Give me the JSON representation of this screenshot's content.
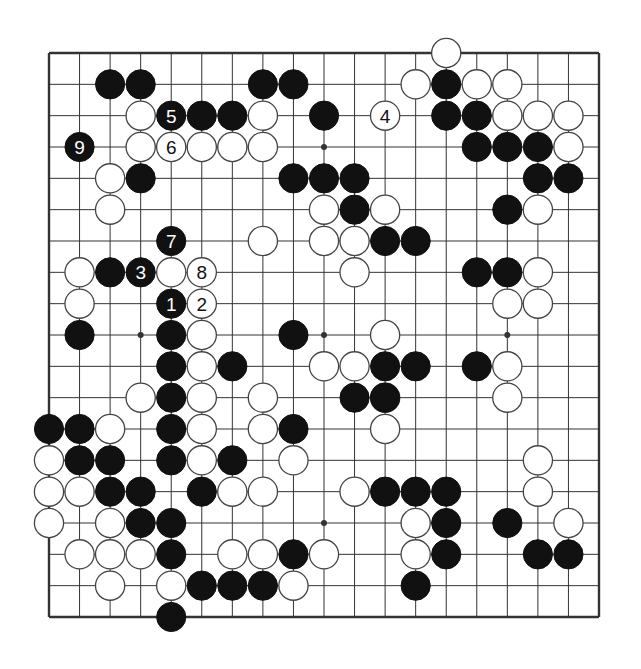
{
  "diagram": {
    "type": "go-board-partial",
    "size": 19,
    "geometry": {
      "x0": 49,
      "y0": 53,
      "x1": 599,
      "y1": 617
    },
    "star_points": [
      [
        3,
        9
      ],
      [
        9,
        3
      ],
      [
        9,
        9
      ],
      [
        9,
        15
      ],
      [
        15,
        9
      ],
      [
        3,
        3
      ],
      [
        15,
        15
      ],
      [
        3,
        15
      ],
      [
        15,
        3
      ]
    ],
    "visible_star_points": [
      [
        9,
        3
      ],
      [
        3,
        9
      ],
      [
        9,
        9
      ],
      [
        9,
        15
      ],
      [
        15,
        9
      ]
    ],
    "colors": {
      "line": "#333333",
      "black": "#111111",
      "white": "#ffffff",
      "outline": "#444444",
      "label_on_black": "#ffffff",
      "label_on_white": "#111111"
    },
    "black_stones": [
      [
        1,
        2
      ],
      [
        1,
        3
      ],
      [
        1,
        7
      ],
      [
        1,
        8
      ],
      [
        1,
        13
      ],
      [
        2,
        4,
        "5"
      ],
      [
        2,
        5
      ],
      [
        2,
        6
      ],
      [
        2,
        9
      ],
      [
        2,
        13
      ],
      [
        2,
        14
      ],
      [
        3,
        1,
        "9"
      ],
      [
        3,
        14
      ],
      [
        3,
        15
      ],
      [
        3,
        16
      ],
      [
        4,
        3
      ],
      [
        4,
        8
      ],
      [
        4,
        9
      ],
      [
        4,
        10
      ],
      [
        4,
        16
      ],
      [
        4,
        17
      ],
      [
        5,
        10
      ],
      [
        5,
        15
      ],
      [
        6,
        4,
        "7"
      ],
      [
        6,
        11
      ],
      [
        6,
        12
      ],
      [
        7,
        2
      ],
      [
        7,
        3,
        "3"
      ],
      [
        7,
        14
      ],
      [
        7,
        15
      ],
      [
        8,
        4,
        "1"
      ],
      [
        9,
        1
      ],
      [
        9,
        4
      ],
      [
        9,
        8
      ],
      [
        10,
        4
      ],
      [
        10,
        6
      ],
      [
        10,
        11
      ],
      [
        10,
        12
      ],
      [
        10,
        14
      ],
      [
        11,
        4
      ],
      [
        11,
        10
      ],
      [
        11,
        11
      ],
      [
        12,
        0
      ],
      [
        12,
        1
      ],
      [
        12,
        4
      ],
      [
        12,
        8
      ],
      [
        13,
        1
      ],
      [
        13,
        2
      ],
      [
        13,
        4
      ],
      [
        13,
        6
      ],
      [
        14,
        2
      ],
      [
        14,
        3
      ],
      [
        14,
        5
      ],
      [
        14,
        11
      ],
      [
        14,
        12
      ],
      [
        14,
        13
      ],
      [
        15,
        3
      ],
      [
        15,
        4
      ],
      [
        15,
        13
      ],
      [
        15,
        15
      ],
      [
        16,
        4
      ],
      [
        16,
        8
      ],
      [
        16,
        13
      ],
      [
        16,
        16
      ],
      [
        16,
        17
      ],
      [
        17,
        5
      ],
      [
        17,
        6
      ],
      [
        17,
        7
      ],
      [
        17,
        12
      ],
      [
        18,
        4
      ]
    ],
    "white_stones": [
      [
        0,
        13
      ],
      [
        1,
        12
      ],
      [
        1,
        14
      ],
      [
        1,
        15
      ],
      [
        2,
        3
      ],
      [
        2,
        7
      ],
      [
        2,
        11,
        "4"
      ],
      [
        2,
        15
      ],
      [
        2,
        16
      ],
      [
        2,
        17
      ],
      [
        3,
        3
      ],
      [
        3,
        4,
        "6"
      ],
      [
        3,
        5
      ],
      [
        3,
        6
      ],
      [
        3,
        7
      ],
      [
        3,
        17
      ],
      [
        4,
        2
      ],
      [
        5,
        2
      ],
      [
        5,
        9
      ],
      [
        5,
        11
      ],
      [
        5,
        16
      ],
      [
        6,
        7
      ],
      [
        6,
        9
      ],
      [
        6,
        10
      ],
      [
        7,
        1
      ],
      [
        7,
        4
      ],
      [
        7,
        5,
        "8"
      ],
      [
        7,
        10
      ],
      [
        7,
        16
      ],
      [
        8,
        1
      ],
      [
        8,
        5,
        "2"
      ],
      [
        8,
        15
      ],
      [
        8,
        16
      ],
      [
        9,
        5
      ],
      [
        9,
        11
      ],
      [
        10,
        5
      ],
      [
        10,
        9
      ],
      [
        10,
        10
      ],
      [
        10,
        15
      ],
      [
        11,
        3
      ],
      [
        11,
        5
      ],
      [
        11,
        7
      ],
      [
        11,
        11
      ],
      [
        11,
        15
      ],
      [
        12,
        2
      ],
      [
        12,
        5
      ],
      [
        12,
        7
      ],
      [
        12,
        11
      ],
      [
        13,
        0
      ],
      [
        13,
        5
      ],
      [
        13,
        8
      ],
      [
        13,
        16
      ],
      [
        14,
        0
      ],
      [
        14,
        1
      ],
      [
        14,
        6
      ],
      [
        14,
        7
      ],
      [
        14,
        10
      ],
      [
        14,
        16
      ],
      [
        15,
        0
      ],
      [
        15,
        2
      ],
      [
        15,
        12
      ],
      [
        15,
        17
      ],
      [
        16,
        1
      ],
      [
        16,
        2
      ],
      [
        16,
        3
      ],
      [
        16,
        6
      ],
      [
        16,
        7
      ],
      [
        16,
        9
      ],
      [
        16,
        12
      ],
      [
        17,
        2
      ],
      [
        17,
        4
      ],
      [
        17,
        8
      ]
    ],
    "move_labels": [
      "1",
      "2",
      "3",
      "4",
      "5",
      "6",
      "7",
      "8",
      "9"
    ]
  }
}
